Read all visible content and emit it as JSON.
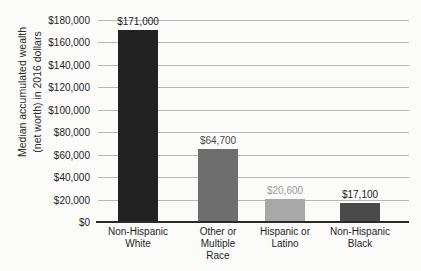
{
  "chart_data": {
    "type": "bar",
    "title": "",
    "xlabel": "",
    "ylabel": "Median accumulated wealth (net worth) in 2016 dollars",
    "ylabel_line1": "Median accumulated wealth",
    "ylabel_line2": "(net worth) in 2016 dollars",
    "categories": [
      "Non-Hispanic White",
      "Other or Multiple Race",
      "Hispanic or Latino",
      "Non-Hispanic Black"
    ],
    "category_label_lines": [
      "Non-Hispanic\nWhite",
      "Other or\nMultiple\nRace",
      "Hispanic or\nLatino",
      "Non-Hispanic\nBlack"
    ],
    "values": [
      171000,
      64700,
      20600,
      17100
    ],
    "value_labels": [
      "$171,000",
      "$64,700",
      "$20,600",
      "$17,100"
    ],
    "bar_colors": [
      "#222222",
      "#6e6e6e",
      "#a8a8a8",
      "#4a4a4a"
    ],
    "value_label_colors": [
      "#1a1a1a",
      "#4a4a4a",
      "#9a9a9a",
      "#1a1a1a"
    ],
    "ylim": [
      0,
      180000
    ],
    "ytick_values": [
      0,
      20000,
      40000,
      60000,
      80000,
      100000,
      120000,
      140000,
      160000,
      180000
    ],
    "ytick_labels": [
      "$0",
      "$20,000",
      "$40,000",
      "$60,000",
      "$80,000",
      "$100,000",
      "$120,000",
      "$140,000",
      "$160,000",
      "$180,000"
    ],
    "grid": true,
    "grid_axis": "y",
    "legend": false,
    "legend_position": "none"
  }
}
